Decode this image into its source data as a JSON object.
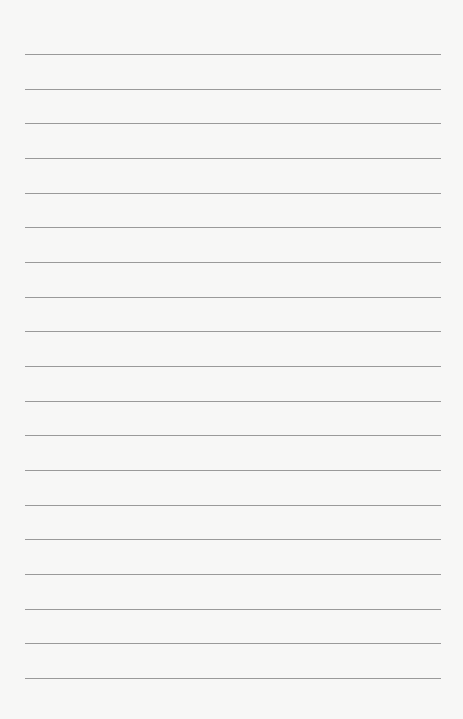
{
  "page": {
    "type": "lined-paper",
    "background_color": "#f7f7f6",
    "line_color": "#8a8a8a",
    "line_count": 19,
    "first_line_y": 54,
    "line_spacing": 34.67,
    "line_left": 25,
    "line_width": 416
  }
}
